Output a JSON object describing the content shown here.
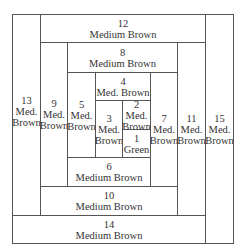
{
  "diagram": {
    "type": "log-cabin-quilt-block",
    "blocks": [
      {
        "num": "1",
        "label": "Green"
      },
      {
        "num": "2",
        "label_lines": [
          "Med.",
          "Brown"
        ]
      },
      {
        "num": "3",
        "label_lines": [
          "Med.",
          "Brown"
        ]
      },
      {
        "num": "4",
        "label": "Med. Brown"
      },
      {
        "num": "5",
        "label_lines": [
          "Med.",
          "Brown"
        ]
      },
      {
        "num": "6",
        "label": "Medium Brown"
      },
      {
        "num": "7",
        "label_lines": [
          "Med.",
          "Brown"
        ]
      },
      {
        "num": "8",
        "label": "Medium Brown"
      },
      {
        "num": "9",
        "label_lines": [
          "Med.",
          "Brown"
        ]
      },
      {
        "num": "10",
        "label": "Medium Brown"
      },
      {
        "num": "11",
        "label_lines": [
          "Med.",
          "Brown"
        ]
      },
      {
        "num": "12",
        "label": "Medium Brown"
      },
      {
        "num": "13",
        "label_lines": [
          "Med.",
          "Brown"
        ]
      },
      {
        "num": "14",
        "label": "Medium Brown"
      },
      {
        "num": "15",
        "label_lines": [
          "Med.",
          "Brown"
        ]
      }
    ]
  }
}
